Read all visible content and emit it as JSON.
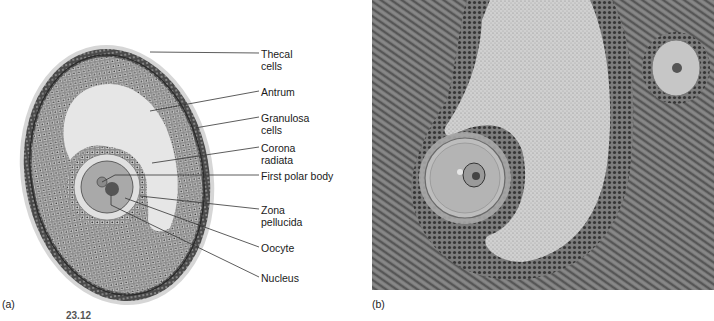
{
  "panel_a": {
    "letter": "(a)",
    "labels": [
      {
        "text": "Thecal\ncells",
        "x": 261,
        "y": 48,
        "line_from": [
          150,
          52
        ]
      },
      {
        "text": "Antrum",
        "x": 261,
        "y": 86,
        "line_from": [
          150,
          111
        ]
      },
      {
        "text": "Granulosa\ncells",
        "x": 261,
        "y": 112,
        "line_from": [
          195,
          128
        ]
      },
      {
        "text": "Corona\nradiata",
        "x": 261,
        "y": 142,
        "line_from": [
          152,
          163
        ]
      },
      {
        "text": "First polar body",
        "x": 261,
        "y": 170,
        "line_from": [
          102,
          175
        ]
      },
      {
        "text": "Zona\npellucida",
        "x": 261,
        "y": 204,
        "line_from": [
          140,
          196
        ]
      },
      {
        "text": "Oocyte",
        "x": 261,
        "y": 242,
        "line_from": [
          125,
          198
        ]
      },
      {
        "text": "Nucleus",
        "x": 261,
        "y": 272,
        "line_from": [
          111,
          195
        ]
      }
    ],
    "colors": {
      "theca": "#5a5a5a",
      "granulosa": "#7a7a7a",
      "antrum": "#e6e6e6",
      "zona": "#e0e0e0",
      "oocyte": "#a9a9a9",
      "nucleus": "#555555",
      "polar_body": "#8a8a8a"
    }
  },
  "panel_b": {
    "letter": "(b)",
    "colors": {
      "stroma": "#6b6b6b",
      "antrum_fluid": "#c9c9c9",
      "granulosa": "#4e4e4e",
      "oocyte": "#b8b8b8"
    }
  },
  "figure_number": "23.12"
}
